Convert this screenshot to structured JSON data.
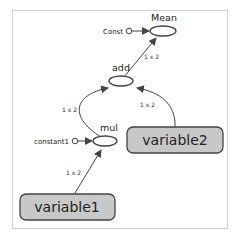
{
  "diagram": {
    "type": "computation-graph",
    "nodes": [
      {
        "id": "mean",
        "label": "Mean",
        "kind": "op"
      },
      {
        "id": "const",
        "label": "Const",
        "kind": "constant"
      },
      {
        "id": "add",
        "label": "add",
        "kind": "op"
      },
      {
        "id": "mul",
        "label": "mul",
        "kind": "op"
      },
      {
        "id": "constant1",
        "label": "constant1",
        "kind": "constant"
      },
      {
        "id": "variable1",
        "label": "variable1",
        "kind": "variable"
      },
      {
        "id": "variable2",
        "label": "variable2",
        "kind": "variable"
      }
    ],
    "edges": [
      {
        "from": "const",
        "to": "mean",
        "label": ""
      },
      {
        "from": "add",
        "to": "mean",
        "label": "1 x 2"
      },
      {
        "from": "mul",
        "to": "add",
        "label": "1 x 2"
      },
      {
        "from": "variable2",
        "to": "add",
        "label": "1 x 2"
      },
      {
        "from": "constant1",
        "to": "mul",
        "label": ""
      },
      {
        "from": "variable1",
        "to": "mul",
        "label": "1 x 2"
      }
    ]
  },
  "colors": {
    "variable_fill": "#c8c8c8",
    "stroke": "#444444",
    "frame_border": "#cfcfcf"
  }
}
